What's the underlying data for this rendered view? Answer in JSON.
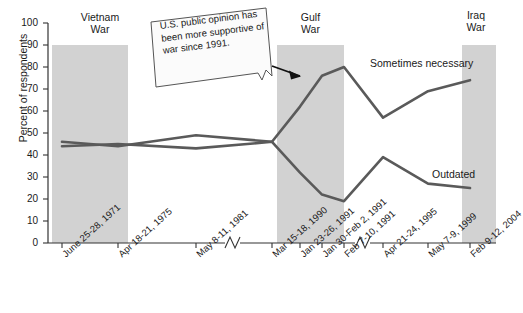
{
  "chart_data": {
    "type": "line",
    "title": "",
    "subtitle": "",
    "xlabel": "",
    "ylabel": "Percent of respondents",
    "ylim": [
      0,
      100
    ],
    "yticks": [
      0,
      10,
      20,
      30,
      40,
      50,
      60,
      70,
      80,
      90,
      100
    ],
    "grid": false,
    "legend_position": "inline-right",
    "axis_breaks": [
      {
        "after_category": "May 8-11, 1981"
      },
      {
        "after_category": "Feb 7-10, 1991"
      }
    ],
    "categories": [
      "June 25-28, 1971",
      "Apr 18-21, 1975",
      "May 8-11, 1981",
      "Mar 15-18, 1990",
      "Jan 23-26, 1991",
      "Jan 30-Feb 2, 1991",
      "Feb 7-10, 1991",
      "Apr 21-24, 1995",
      "May 7-9, 1999",
      "Feb 9-12, 2004"
    ],
    "series": [
      {
        "name": "Sometimes necessary",
        "color": "#5a5a5a",
        "values": [
          46,
          44,
          49,
          46,
          62,
          76,
          80,
          57,
          69,
          74
        ]
      },
      {
        "name": "Outdated",
        "color": "#5a5a5a",
        "values": [
          44,
          45,
          43,
          46,
          32,
          22,
          19,
          39,
          27,
          25
        ]
      }
    ],
    "bands": [
      {
        "label_line1": "Vietnam",
        "label_line2": "War",
        "start_category": "June 25-28, 1971",
        "end_category": "Apr 18-21, 1975",
        "color": "#d2d2d2",
        "top_value": 90
      },
      {
        "label_line1": "Gulf",
        "label_line2": "War",
        "start_category": "Jan 23-26, 1991",
        "end_category": "Feb 7-10, 1991",
        "color": "#d2d2d2",
        "top_value": 90
      },
      {
        "label_line1": "Iraq",
        "label_line2": "War",
        "start_category": "Feb 9-12, 2004",
        "end_category": "Feb 9-12, 2004",
        "color": "#d2d2d2",
        "top_value": 90
      }
    ],
    "annotations": [
      {
        "name": "callout",
        "text": "U.S. public opinion has been more supportive of war since 1991.",
        "arrow_to_category": "Jan 23-26, 1991"
      }
    ]
  },
  "axis": {
    "y_title": "Percent of respondents",
    "tick_100": "100",
    "tick_90": "90",
    "tick_80": "80",
    "tick_70": "70",
    "tick_60": "60",
    "tick_50": "50",
    "tick_40": "40",
    "tick_30": "30",
    "tick_20": "20",
    "tick_10": "10",
    "tick_0": "0"
  },
  "bands_text": {
    "vietnam_l1": "Vietnam",
    "vietnam_l2": "War",
    "gulf_l1": "Gulf",
    "gulf_l2": "War",
    "iraq_l1": "Iraq",
    "iraq_l2": "War"
  },
  "series_text": {
    "sometimes_necessary": "Sometimes necessary",
    "outdated": "Outdated"
  },
  "callout_text": "U.S. public opinion has been more supportive of war since 1991.",
  "xlabels": [
    "June 25-28, 1971",
    "Apr 18-21, 1975",
    "May 8-11, 1981",
    "Mar 15-18, 1990",
    "Jan 23-26, 1991",
    "Jan 30-Feb 2, 1991",
    "Feb 7-10, 1991",
    "Apr 21-24, 1995",
    "May 7-9, 1999",
    "Feb 9-12, 2004"
  ]
}
